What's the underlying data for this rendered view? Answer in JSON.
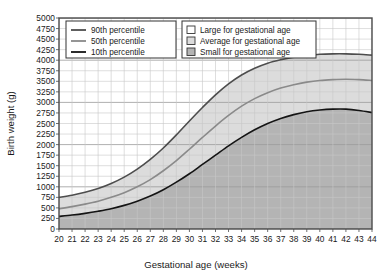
{
  "chart_data": {
    "type": "line",
    "title": "",
    "xlabel": "Gestational age (weeks)",
    "ylabel": "Birth weight (g)",
    "xlim": [
      20,
      44
    ],
    "ylim": [
      0,
      5000
    ],
    "xticks": [
      20,
      21,
      22,
      23,
      24,
      25,
      26,
      27,
      28,
      29,
      30,
      31,
      32,
      33,
      34,
      35,
      36,
      37,
      38,
      39,
      40,
      41,
      42,
      43,
      44
    ],
    "yticks": [
      0,
      250,
      500,
      750,
      1000,
      1250,
      1500,
      1750,
      2000,
      2250,
      2500,
      2750,
      3000,
      3250,
      3500,
      3750,
      4000,
      4250,
      4500,
      4750,
      5000
    ],
    "grid": true,
    "legend_position": "top-left",
    "x": [
      20,
      21,
      22,
      23,
      24,
      25,
      26,
      27,
      28,
      29,
      30,
      31,
      32,
      33,
      34,
      35,
      36,
      37,
      38,
      39,
      40,
      41,
      42,
      43,
      44
    ],
    "series": [
      {
        "name": "90th percentile",
        "color": "#4d4d4d",
        "values": [
          750,
          800,
          870,
          960,
          1080,
          1230,
          1420,
          1650,
          1920,
          2230,
          2560,
          2880,
          3180,
          3440,
          3650,
          3810,
          3930,
          4010,
          4070,
          4110,
          4140,
          4150,
          4150,
          4140,
          4120
        ]
      },
      {
        "name": "50th percentile",
        "color": "#8a8a8a",
        "values": [
          480,
          530,
          590,
          660,
          750,
          860,
          1000,
          1170,
          1380,
          1620,
          1890,
          2170,
          2440,
          2690,
          2910,
          3090,
          3230,
          3340,
          3420,
          3480,
          3520,
          3540,
          3550,
          3540,
          3520
        ]
      },
      {
        "name": "10th percentile",
        "color": "#141414",
        "values": [
          300,
          330,
          370,
          420,
          480,
          560,
          660,
          780,
          930,
          1110,
          1310,
          1530,
          1750,
          1970,
          2170,
          2350,
          2500,
          2620,
          2710,
          2780,
          2820,
          2840,
          2840,
          2810,
          2760
        ]
      }
    ],
    "bands": [
      {
        "name": "Large for gestational age",
        "fill": "#ffffff",
        "between": [
          "90th percentile",
          "top"
        ]
      },
      {
        "name": "Average for gestational age",
        "fill": "#dcdcdc",
        "between": [
          "50th percentile",
          "90th percentile"
        ]
      },
      {
        "name": "Small for gestational age",
        "fill": "#b4b4b4",
        "between": [
          "bottom",
          "10th percentile"
        ]
      }
    ]
  },
  "legend_lines": {
    "title": "",
    "items": [
      {
        "label": "90th percentile",
        "color": "#4d4d4d"
      },
      {
        "label": "50th percentile",
        "color": "#8a8a8a"
      },
      {
        "label": "10th percentile",
        "color": "#141414"
      }
    ]
  },
  "legend_bands": {
    "title": "",
    "items": [
      {
        "label": "Large for gestational age",
        "fill": "#ffffff"
      },
      {
        "label": "Average for gestational age",
        "fill": "#dcdcdc"
      },
      {
        "label": "Small for gestational age",
        "fill": "#b4b4b4"
      }
    ]
  },
  "axes": {
    "x_title": "Gestational age (weeks)",
    "y_title": "Birth weight (g)"
  },
  "colors": {
    "plot_background": "#ffffff",
    "grid_minor": "#c8c8c8",
    "grid_major": "#9a9a9a",
    "axis_frame": "#4a4a4a",
    "band_average": "#dcdcdc",
    "band_small": "#b4b4b4",
    "text": "#1a1a1a"
  }
}
